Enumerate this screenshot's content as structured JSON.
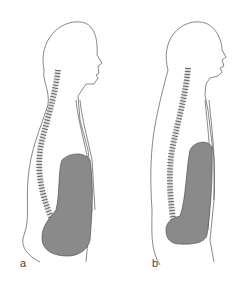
{
  "figure": {
    "panels": [
      {
        "id": "a",
        "label": "a",
        "description": "Side profile of human figure with spine and large filled abdominal organ"
      },
      {
        "id": "b",
        "label": "b",
        "description": "Side profile of human figure with straighter spine and narrower filled abdominal organ"
      }
    ],
    "colors": {
      "outline": "#555555",
      "organ_fill": "#8a8a8a",
      "background": "#ffffff"
    }
  }
}
